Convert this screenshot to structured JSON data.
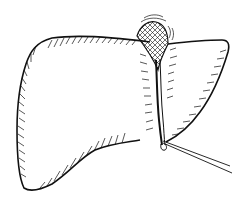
{
  "figure": {
    "subject": "Line drawing of a liver with a ligature cord at the central fissure",
    "style": "black ink hatched illustration on white",
    "colors": {
      "ink": "#111111",
      "background": "#ffffff"
    },
    "parts": [
      {
        "id": "left-lobe",
        "label": "Left lobe"
      },
      {
        "id": "right-lobe",
        "label": "Right lobe"
      },
      {
        "id": "hilum-tissue",
        "label": "Cross-hatched tissue at top notch"
      },
      {
        "id": "ligament",
        "label": "Central ligament / fissure"
      },
      {
        "id": "ligature",
        "label": "Ligature threads"
      }
    ]
  }
}
